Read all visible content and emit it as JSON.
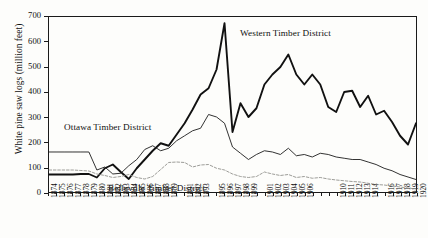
{
  "chart_data": {
    "type": "line",
    "title": "",
    "xlabel": "",
    "ylabel": "White pine saw logs (million feet)",
    "ylim": [
      0,
      700
    ],
    "yticks": [
      0,
      100,
      200,
      300,
      400,
      500,
      600,
      700
    ],
    "grid": false,
    "legend_position": "in-plot annotations",
    "x": [
      1874,
      1875,
      1876,
      1877,
      1878,
      1879,
      1880,
      1881,
      1882,
      1883,
      1884,
      1885,
      1886,
      1887,
      1888,
      1889,
      1890,
      1891,
      1892,
      1893,
      1894,
      1895,
      1896,
      1897,
      1898,
      1899,
      1900,
      1901,
      1902,
      1903,
      1904,
      1905,
      1906,
      1907,
      1908,
      1909,
      1910,
      1911,
      1912,
      1913,
      1914,
      1915,
      1916,
      1917,
      1918,
      1919,
      1920
    ],
    "xtick_labels": [
      "1874",
      "1875",
      "1876",
      "1877",
      "1878",
      "1879",
      "1880",
      "1881",
      "1882",
      "1883",
      "1884",
      "1885",
      "1886",
      "1887",
      "1888",
      "1889",
      "",
      "1891",
      "1892",
      "1893",
      "",
      "1895",
      "1896",
      "1897",
      "1898",
      "1899",
      "",
      "1901",
      "1902",
      "1903",
      "1904",
      "1905",
      "1906",
      "",
      "",
      "",
      "1910",
      "1911",
      "1912",
      "1913",
      "1914",
      "",
      "1916",
      "1917",
      "1918",
      "1919",
      "1920"
    ],
    "series": [
      {
        "name": "Western Timber District",
        "style": "thick-solid",
        "color": "#111111",
        "values": [
          70,
          70,
          70,
          70,
          72,
          72,
          58,
          95,
          110,
          80,
          52,
          95,
          130,
          165,
          195,
          185,
          230,
          275,
          330,
          390,
          415,
          490,
          675,
          240,
          355,
          300,
          335,
          430,
          470,
          500,
          550,
          470,
          430,
          470,
          430,
          340,
          320,
          400,
          405,
          340,
          385,
          310,
          325,
          280,
          225,
          190,
          275
        ]
      },
      {
        "name": "Ottawa Timber District",
        "style": "thin-solid",
        "color": "#1a1a1a",
        "values": [
          160,
          160,
          160,
          160,
          160,
          160,
          88,
          100,
          72,
          75,
          105,
          130,
          170,
          185,
          165,
          175,
          205,
          225,
          245,
          255,
          310,
          300,
          275,
          180,
          155,
          130,
          150,
          165,
          160,
          150,
          175,
          145,
          150,
          140,
          155,
          150,
          140,
          135,
          130,
          130,
          120,
          110,
          95,
          85,
          70,
          60,
          50
        ]
      },
      {
        "name": "Belleville Timber District",
        "style": "dashed",
        "color": "#8a8a85",
        "values": [
          88,
          88,
          88,
          88,
          86,
          84,
          72,
          66,
          58,
          62,
          70,
          58,
          52,
          62,
          90,
          118,
          120,
          118,
          100,
          108,
          110,
          95,
          88,
          72,
          62,
          58,
          62,
          80,
          72,
          66,
          70,
          58,
          62,
          55,
          58,
          52,
          48,
          45,
          42,
          40,
          35,
          30,
          28,
          24,
          20,
          16,
          12
        ]
      }
    ],
    "annotations": [
      {
        "text": "Western Timber District",
        "x": 1896,
        "y": 610
      },
      {
        "text": "Ottawa Timber District",
        "x": 1882,
        "y": 290
      },
      {
        "text": "Belleville Timber District",
        "x": 1886,
        "y": 48
      }
    ]
  }
}
